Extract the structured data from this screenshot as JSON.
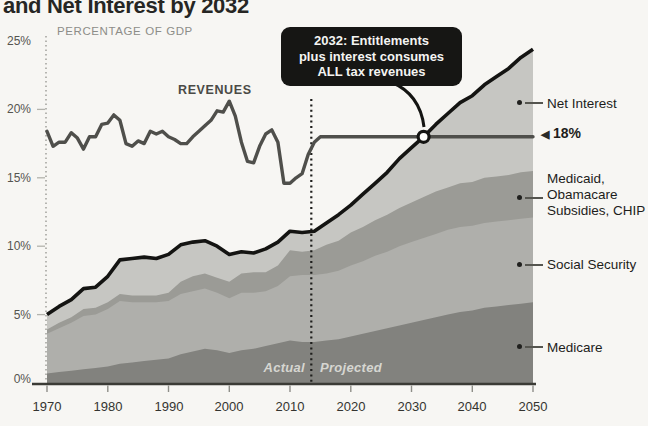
{
  "title": "and Net Interest by 2032",
  "icons": {
    "left_arrow": "◀"
  },
  "chart_data": {
    "type": "area",
    "title": "and Net Interest by 2032",
    "inner_axis_title": "PERCENTAGE OF GDP",
    "xlim": [
      1970,
      2050
    ],
    "ylim": [
      0,
      25
    ],
    "grid": false,
    "y_tick_labels": [
      "25%",
      "20%",
      "15%",
      "10%",
      "5%",
      "0%"
    ],
    "y_tick_values": [
      25,
      20,
      15,
      10,
      5,
      0
    ],
    "x_ticks": [
      1970,
      1980,
      1990,
      2000,
      2010,
      2020,
      2030,
      2040,
      2050
    ],
    "actual_label": "Actual",
    "projected_label": "Projected",
    "divider_year": 2013.5,
    "annotation": {
      "text": "2032: Entitlements\nplus interest consumes\nALL tax revenues",
      "bg": "#161614"
    },
    "crossover": {
      "year": 2032,
      "value": 18
    },
    "legend": {
      "net_interest": "Net Interest",
      "rate_marker": "18%",
      "medicaid": "Medicaid,\nObamacare\nSubsidies, CHIP",
      "social_security": "Social Security",
      "medicare": "Medicare"
    },
    "years": [
      1970,
      1972,
      1974,
      1976,
      1978,
      1980,
      1982,
      1984,
      1986,
      1988,
      1990,
      1992,
      1994,
      1996,
      1998,
      2000,
      2002,
      2004,
      2006,
      2008,
      2010,
      2012,
      2014,
      2016,
      2018,
      2020,
      2022,
      2024,
      2026,
      2028,
      2030,
      2032,
      2034,
      2036,
      2038,
      2040,
      2042,
      2044,
      2046,
      2048,
      2050
    ],
    "series": [
      {
        "name": "Medicare",
        "color": "#82827e",
        "values": [
          0.7,
          0.8,
          0.9,
          1.0,
          1.1,
          1.2,
          1.4,
          1.5,
          1.6,
          1.7,
          1.8,
          2.1,
          2.3,
          2.5,
          2.4,
          2.2,
          2.4,
          2.5,
          2.7,
          2.9,
          3.1,
          3.0,
          3.0,
          3.1,
          3.2,
          3.4,
          3.6,
          3.8,
          4.0,
          4.2,
          4.4,
          4.6,
          4.8,
          5.0,
          5.2,
          5.3,
          5.5,
          5.6,
          5.7,
          5.8,
          5.9
        ]
      },
      {
        "name": "Social Security",
        "color": "#afafab",
        "values": [
          2.9,
          3.2,
          3.5,
          3.9,
          3.9,
          4.2,
          4.6,
          4.4,
          4.3,
          4.2,
          4.2,
          4.4,
          4.4,
          4.4,
          4.2,
          4.0,
          4.2,
          4.1,
          4.0,
          4.2,
          4.7,
          4.9,
          4.9,
          4.9,
          5.0,
          5.2,
          5.3,
          5.5,
          5.6,
          5.8,
          5.9,
          6.0,
          6.1,
          6.2,
          6.2,
          6.2,
          6.2,
          6.2,
          6.2,
          6.2,
          6.2
        ]
      },
      {
        "name": "Medicaid, Obamacare Subsidies, CHIP",
        "color": "#9b9b96",
        "values": [
          0.3,
          0.4,
          0.4,
          0.5,
          0.5,
          0.5,
          0.5,
          0.5,
          0.5,
          0.5,
          0.6,
          0.9,
          1.1,
          1.1,
          1.1,
          1.2,
          1.4,
          1.5,
          1.4,
          1.5,
          1.9,
          1.7,
          1.8,
          2.1,
          2.2,
          2.4,
          2.5,
          2.6,
          2.7,
          2.8,
          2.9,
          3.0,
          3.1,
          3.1,
          3.2,
          3.2,
          3.3,
          3.3,
          3.3,
          3.4,
          3.4
        ]
      },
      {
        "name": "Net Interest",
        "color": "#c6c6c2",
        "values": [
          1.1,
          1.2,
          1.3,
          1.5,
          1.5,
          1.9,
          2.5,
          2.7,
          2.8,
          2.7,
          2.8,
          2.7,
          2.5,
          2.4,
          2.3,
          2.0,
          1.6,
          1.4,
          1.7,
          1.7,
          1.4,
          1.4,
          1.4,
          1.6,
          1.9,
          2.0,
          2.4,
          2.7,
          3.1,
          3.6,
          4.0,
          4.4,
          4.9,
          5.4,
          5.9,
          6.3,
          6.8,
          7.3,
          7.8,
          8.4,
          8.9
        ]
      }
    ],
    "revenues": {
      "label": "REVENUES",
      "color": "#4f4f4b",
      "flat_projection": 18,
      "years": [
        1970,
        1971,
        1972,
        1973,
        1974,
        1975,
        1976,
        1977,
        1978,
        1979,
        1980,
        1981,
        1982,
        1983,
        1984,
        1985,
        1986,
        1987,
        1988,
        1989,
        1990,
        1991,
        1992,
        1993,
        1994,
        1995,
        1996,
        1997,
        1998,
        1999,
        2000,
        2001,
        2002,
        2003,
        2004,
        2005,
        2006,
        2007,
        2008,
        2009,
        2010,
        2011,
        2012,
        2013,
        2014,
        2015,
        2016,
        2050
      ],
      "values": [
        18.4,
        17.3,
        17.6,
        17.6,
        18.3,
        17.9,
        17.1,
        18.0,
        18.0,
        18.9,
        19.0,
        19.6,
        19.2,
        17.5,
        17.3,
        17.7,
        17.5,
        18.4,
        18.2,
        18.4,
        18.0,
        17.8,
        17.5,
        17.5,
        18.0,
        18.4,
        18.8,
        19.2,
        19.9,
        19.8,
        20.6,
        19.5,
        17.6,
        16.2,
        16.1,
        17.3,
        18.2,
        18.5,
        17.6,
        14.6,
        14.6,
        15.0,
        15.3,
        16.7,
        17.6,
        18.0,
        18.0,
        18.0
      ]
    }
  }
}
